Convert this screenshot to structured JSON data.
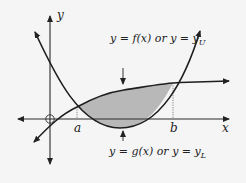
{
  "diagram": {
    "type": "area-between-curves",
    "axes": {
      "x_label": "x",
      "y_label": "y",
      "origin_marker": "circle"
    },
    "points": {
      "a_label": "a",
      "b_label": "b"
    },
    "curves": {
      "upper": {
        "label_prefix": "y = f(x)  or  y = y",
        "label_sub": "U",
        "shape": "increasing-logarithmic"
      },
      "lower": {
        "label_prefix": "y = g(x)  or  y = y",
        "label_sub": "L",
        "shape": "upward-parabola"
      }
    },
    "shaded_region": {
      "description": "region between f(x) above and g(x) below from x=a to x=b",
      "fill": "#b8b8b8"
    },
    "colors": {
      "curve": "#1e1e1e",
      "axis": "#2a2a2a",
      "background": "#f5f5f5",
      "guide_dotted": "#555555"
    }
  }
}
